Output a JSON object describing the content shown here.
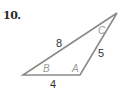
{
  "problem": {
    "number": "10."
  },
  "triangle": {
    "stroke_color": "#8a8a8a",
    "vertices": {
      "B": {
        "label": "B",
        "x": 23,
        "y": 75
      },
      "A": {
        "label": "A",
        "x": 80,
        "y": 75
      },
      "C": {
        "label": "C",
        "x": 117,
        "y": 13
      }
    },
    "sides": {
      "BC": "8",
      "AC": "5",
      "AB": "4"
    },
    "angle_label_color": "#9a9a9a"
  }
}
